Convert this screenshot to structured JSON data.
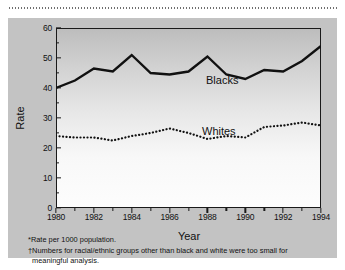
{
  "figure": {
    "y_axis_title": "Rate",
    "x_axis_title": "Year",
    "series_labels": {
      "blacks": "Blacks",
      "whites": "Whites"
    },
    "footnotes": [
      "*Rate per 1000 population.",
      "†Numbers for racial/ethnic groups other than black and white were too small for",
      "meaningful analysis."
    ],
    "colors": {
      "line": "#111111",
      "panel": "#c3c3c3",
      "axis": "#1a1a1a"
    }
  },
  "chart_data": {
    "type": "line",
    "title": "",
    "xlabel": "Year",
    "ylabel": "Rate",
    "xlim": [
      1980,
      1994
    ],
    "ylim": [
      0,
      60
    ],
    "ytick_labels": [
      "0",
      "10",
      "20",
      "30",
      "40",
      "50",
      "60"
    ],
    "yticks": [
      0,
      10,
      20,
      30,
      40,
      50,
      60
    ],
    "yticks_minor": [
      5,
      15,
      25,
      35,
      45,
      55
    ],
    "xtick_labels": [
      "1980",
      "1982",
      "1984",
      "1986",
      "1988",
      "1990",
      "1992",
      "1994"
    ],
    "xticks": [
      1980,
      1982,
      1984,
      1986,
      1988,
      1990,
      1992,
      1994
    ],
    "xticks_minor": [
      1981,
      1983,
      1985,
      1987,
      1989,
      1991,
      1993
    ],
    "grid": false,
    "legend_position": "inline-annotation",
    "x": [
      1980,
      1981,
      1982,
      1983,
      1984,
      1985,
      1986,
      1987,
      1988,
      1989,
      1990,
      1991,
      1992,
      1993,
      1994
    ],
    "series": [
      {
        "name": "Blacks",
        "style": "solid",
        "values": [
          40,
          42.5,
          46.5,
          45.5,
          51,
          45,
          44.5,
          45.5,
          50.5,
          44.5,
          43,
          46,
          45.5,
          49,
          54
        ]
      },
      {
        "name": "Whites",
        "style": "dotted",
        "values": [
          24,
          23.5,
          23.5,
          22.5,
          24,
          25,
          26.5,
          25,
          23,
          24,
          23.5,
          27,
          27.5,
          28.5,
          27.5
        ]
      }
    ]
  }
}
